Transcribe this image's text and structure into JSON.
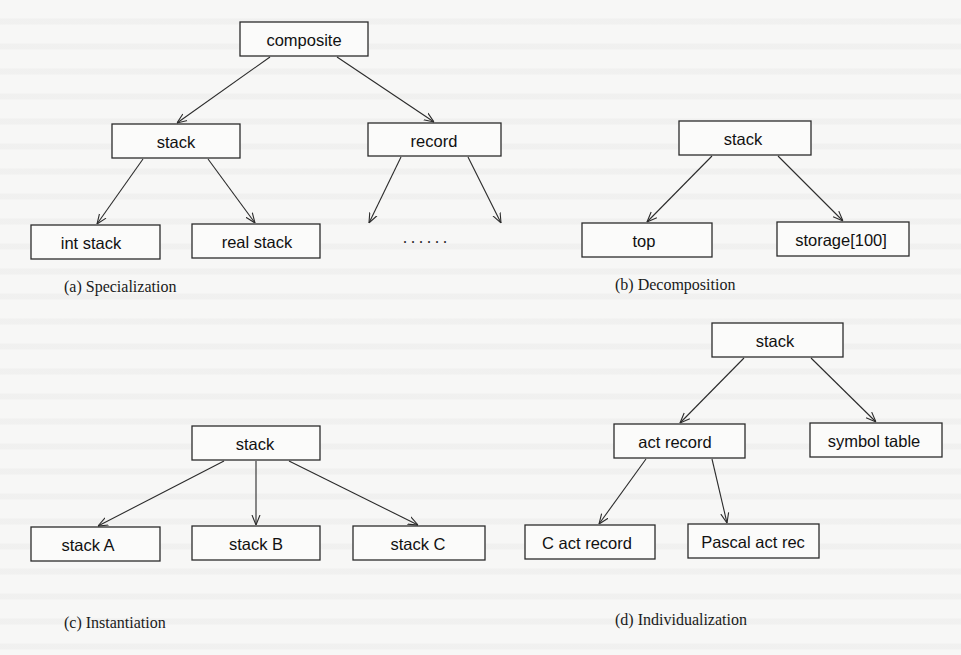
{
  "diagram": {
    "panels": [
      {
        "id": "a",
        "caption": "(a) Specialization",
        "nodes": [
          {
            "id": "composite",
            "label": "composite"
          },
          {
            "id": "stack",
            "label": "stack"
          },
          {
            "id": "record",
            "label": "record"
          },
          {
            "id": "int-stack",
            "label": "int stack"
          },
          {
            "id": "real-stack",
            "label": "real stack"
          }
        ],
        "edges": [
          [
            "composite",
            "stack"
          ],
          [
            "composite",
            "record"
          ],
          [
            "stack",
            "int-stack"
          ],
          [
            "stack",
            "real-stack"
          ],
          [
            "record",
            "..."
          ],
          [
            "record",
            "..."
          ]
        ],
        "ellipsis": "......"
      },
      {
        "id": "b",
        "caption": "(b) Decomposition",
        "nodes": [
          {
            "id": "stack",
            "label": "stack"
          },
          {
            "id": "top",
            "label": "top"
          },
          {
            "id": "storage",
            "label": "storage[100]"
          }
        ],
        "edges": [
          [
            "stack",
            "top"
          ],
          [
            "stack",
            "storage"
          ]
        ]
      },
      {
        "id": "c",
        "caption": "(c) Instantiation",
        "nodes": [
          {
            "id": "stack",
            "label": "stack"
          },
          {
            "id": "stack-a",
            "label": "stack A"
          },
          {
            "id": "stack-b",
            "label": "stack B"
          },
          {
            "id": "stack-c",
            "label": "stack C"
          }
        ],
        "edges": [
          [
            "stack",
            "stack-a"
          ],
          [
            "stack",
            "stack-b"
          ],
          [
            "stack",
            "stack-c"
          ]
        ]
      },
      {
        "id": "d",
        "caption": "(d) Individualization",
        "nodes": [
          {
            "id": "stack",
            "label": "stack"
          },
          {
            "id": "act-record",
            "label": "act record"
          },
          {
            "id": "symbol-table",
            "label": "symbol table"
          },
          {
            "id": "c-act-record",
            "label": "C act record"
          },
          {
            "id": "pascal-act-rec",
            "label": "Pascal act rec"
          }
        ],
        "edges": [
          [
            "stack",
            "act-record"
          ],
          [
            "stack",
            "symbol-table"
          ],
          [
            "act-record",
            "c-act-record"
          ],
          [
            "act-record",
            "pascal-act-rec"
          ]
        ]
      }
    ]
  }
}
